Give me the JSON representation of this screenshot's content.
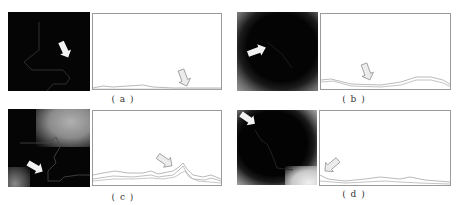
{
  "figure": {
    "panels": [
      {
        "id": "a",
        "caption": "( a )"
      },
      {
        "id": "b",
        "caption": "( b )"
      },
      {
        "id": "c",
        "caption": "( c )"
      },
      {
        "id": "d",
        "caption": "( d )"
      }
    ]
  },
  "colors": {
    "image_background": "#050505",
    "plot_border": "#9a9a9a",
    "curve": "#9c9c9c",
    "arrow_fill_image": "#f2f2f2",
    "arrow_fill_plot": "#d8d8d8"
  }
}
